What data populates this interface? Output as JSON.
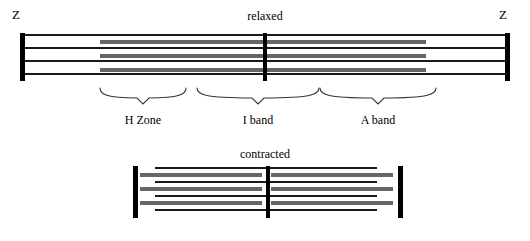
{
  "figure": {
    "title_relaxed": "relaxed",
    "title_contracted": "contracted",
    "z_label_left": "Z",
    "z_label_right": "Z",
    "colors": {
      "thin_filament": "#1a1a1a",
      "thick_filament": "#666666",
      "z_line": "#000000",
      "m_line": "#000000",
      "background": "#ffffff",
      "text": "#000000",
      "brace": "#333333"
    }
  },
  "band_labels": [
    {
      "name": "h-zone",
      "label": "H Zone"
    },
    {
      "name": "i-band",
      "label": "I band"
    },
    {
      "name": "a-band",
      "label": "A band"
    }
  ],
  "relaxed": {
    "name": "relaxed-sarcomere",
    "z_left_x": 20,
    "z_right_x": 505,
    "m_line_x": 263,
    "top": 33,
    "height": 48,
    "thin_rows": [
      {
        "x": 22,
        "y": 34,
        "w": 285
      },
      {
        "x": 22,
        "y": 47,
        "w": 285
      },
      {
        "x": 22,
        "y": 60,
        "w": 285
      },
      {
        "x": 22,
        "y": 73,
        "w": 285
      },
      {
        "x": 222,
        "y": 34,
        "w": 283
      },
      {
        "x": 222,
        "y": 47,
        "w": 283
      },
      {
        "x": 222,
        "y": 60,
        "w": 283
      },
      {
        "x": 222,
        "y": 73,
        "w": 283
      }
    ],
    "thick_rows": [
      {
        "x": 100,
        "y": 40,
        "w": 188
      },
      {
        "x": 100,
        "y": 54,
        "w": 188
      },
      {
        "x": 100,
        "y": 68,
        "w": 188
      },
      {
        "x": 238,
        "y": 40,
        "w": 188
      },
      {
        "x": 238,
        "y": 54,
        "w": 188
      },
      {
        "x": 238,
        "y": 68,
        "w": 188
      }
    ]
  },
  "contracted": {
    "name": "contracted-sarcomere",
    "z_left_x": 133,
    "z_right_x": 398,
    "m_line_x": 266,
    "top": 166,
    "height": 52,
    "thin_rows": [
      {
        "x": 155,
        "y": 167,
        "w": 130
      },
      {
        "x": 155,
        "y": 181,
        "w": 130
      },
      {
        "x": 155,
        "y": 195,
        "w": 130
      },
      {
        "x": 155,
        "y": 209,
        "w": 130
      },
      {
        "x": 247,
        "y": 167,
        "w": 130
      },
      {
        "x": 247,
        "y": 181,
        "w": 130
      },
      {
        "x": 247,
        "y": 195,
        "w": 130
      },
      {
        "x": 247,
        "y": 209,
        "w": 130
      }
    ],
    "thick_rows": [
      {
        "x": 140,
        "y": 173,
        "w": 122
      },
      {
        "x": 140,
        "y": 187,
        "w": 122
      },
      {
        "x": 140,
        "y": 201,
        "w": 122
      },
      {
        "x": 271,
        "y": 173,
        "w": 122
      },
      {
        "x": 271,
        "y": 187,
        "w": 122
      },
      {
        "x": 271,
        "y": 201,
        "w": 122
      }
    ]
  },
  "braces": [
    {
      "name": "brace-h-zone",
      "x": 100,
      "y": 88,
      "w": 86,
      "label_x": 100,
      "label_y": 114,
      "label_w": 86
    },
    {
      "name": "brace-i-band",
      "x": 197,
      "y": 88,
      "w": 122,
      "label_x": 197,
      "label_y": 114,
      "label_w": 122
    },
    {
      "name": "brace-a-band",
      "x": 320,
      "y": 88,
      "w": 116,
      "label_x": 320,
      "label_y": 114,
      "label_w": 116
    }
  ]
}
